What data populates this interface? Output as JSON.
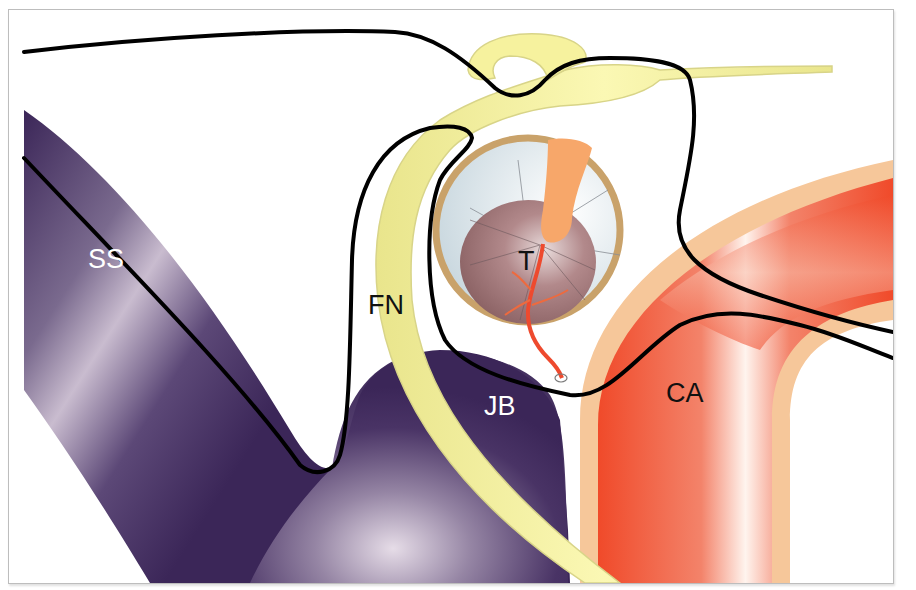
{
  "figure": {
    "type": "anatomical-schematic",
    "labels": {
      "ss": "SS",
      "fn": "FN",
      "t": "T",
      "jb": "JB",
      "ca": "CA"
    },
    "label_colors": {
      "ss": "#ffffff",
      "fn": "#111111",
      "t": "#111111",
      "jb": "#ffffff",
      "ca": "#111111"
    },
    "structures": [
      {
        "id": "ss",
        "label": "SS",
        "color": "#3e2a5c"
      },
      {
        "id": "jb",
        "label": "JB",
        "color": "#3e2a5c"
      },
      {
        "id": "fn",
        "label": "FN",
        "color": "#f7f4a0"
      },
      {
        "id": "t",
        "label": "T",
        "color": "#9a6f72"
      },
      {
        "id": "ca",
        "label": "CA",
        "color": "#f04a2a"
      }
    ],
    "colors": {
      "sinus_dark": "#3b2658",
      "sinus_light": "#c9bccf",
      "nerve": "#f6f29e",
      "nerve_edge": "#d8d488",
      "tumor_ring": "#c9a26a",
      "tumor_cavity": "#e3ebef",
      "tumor_core": "#9a6f72",
      "feeder": "#f7a76a",
      "feeder_vessel": "#ee4a2e",
      "artery": "#f04a2a",
      "artery_sheath": "#f6c79a",
      "outline": "#000000",
      "frame_border": "#bdbdbd"
    }
  }
}
